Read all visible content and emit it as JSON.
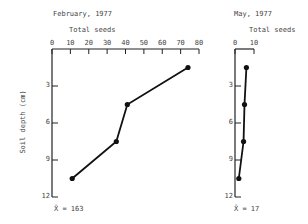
{
  "chart_data": [
    {
      "type": "line",
      "title": "February, 1977",
      "xlabel": "Total seeds",
      "ylabel": "Soil depth (cm)",
      "x_ticks": [
        0,
        10,
        20,
        30,
        40,
        50,
        60,
        70,
        80
      ],
      "y_ticks": [
        3,
        6,
        9,
        12
      ],
      "xlim": [
        0,
        80
      ],
      "ylim": [
        12,
        0
      ],
      "x_axis_position": "top",
      "grid": false,
      "points": [
        {
          "depth": 1.5,
          "seeds": 74
        },
        {
          "depth": 4.5,
          "seeds": 41
        },
        {
          "depth": 7.5,
          "seeds": 35
        },
        {
          "depth": 10.5,
          "seeds": 11
        }
      ],
      "annotation": "X̄ = 163"
    },
    {
      "type": "line",
      "title": "May, 1977",
      "xlabel": "Total seeds",
      "ylabel": "",
      "x_ticks": [
        0,
        10
      ],
      "y_ticks": [
        3,
        6,
        9,
        12
      ],
      "xlim": [
        0,
        10
      ],
      "ylim": [
        12,
        0
      ],
      "x_axis_position": "top",
      "grid": false,
      "points": [
        {
          "depth": 1.5,
          "seeds": 6
        },
        {
          "depth": 4.5,
          "seeds": 5
        },
        {
          "depth": 7.5,
          "seeds": 4.5
        },
        {
          "depth": 10.5,
          "seeds": 2
        }
      ],
      "annotation": "X̄ = 17"
    }
  ],
  "labels": {
    "left_title": "February, 1977",
    "left_xlabel": "Total seeds",
    "ylabel": "Soil depth (cm)",
    "left_mean": "X̄ = 163",
    "right_title": "May, 1977",
    "right_xlabel": "Total seeds",
    "right_mean": "X̄ = 17"
  }
}
